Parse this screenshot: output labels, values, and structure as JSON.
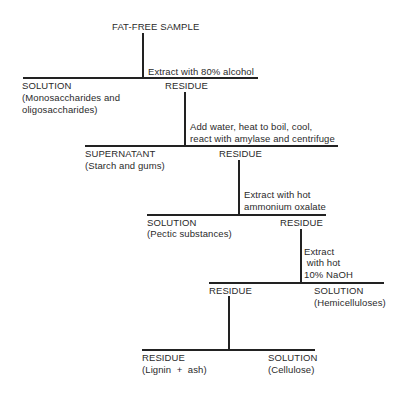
{
  "diagram": {
    "title": "FAT-FREE SAMPLE",
    "steps": [
      {
        "procedure": [
          "Extract with 80% alcohol"
        ],
        "left": {
          "label": "SOLUTION",
          "detail": [
            "(Monosaccharides and",
            "oligosaccharides)"
          ]
        },
        "right": {
          "label": "RESIDUE",
          "detail": []
        }
      },
      {
        "procedure": [
          "Add water, heat to  boil, cool,",
          "react with amylase and centrifuge"
        ],
        "left": {
          "label": "SUPERNATANT",
          "detail": [
            "(Starch and gums)"
          ]
        },
        "right": {
          "label": "RESIDUE",
          "detail": []
        }
      },
      {
        "procedure": [
          "Extract with hot",
          "ammonium oxalate"
        ],
        "left": {
          "label": "SOLUTION",
          "detail": [
            "(Pectic substances)"
          ]
        },
        "right": {
          "label": "RESIDUE",
          "detail": []
        }
      },
      {
        "procedure": [
          "Extract",
          " with hot",
          "10% NaOH"
        ],
        "left": {
          "label": "RESIDUE",
          "detail": []
        },
        "right": {
          "label": "SOLUTION",
          "detail": [
            "(Hemicelluloses)"
          ]
        }
      },
      {
        "procedure": [],
        "left": {
          "label": "RESIDUE",
          "detail": [
            "(Lignin  +  ash)"
          ]
        },
        "right": {
          "label": "SOLUTION",
          "detail": [
            "(Cellulose)"
          ]
        }
      }
    ]
  }
}
